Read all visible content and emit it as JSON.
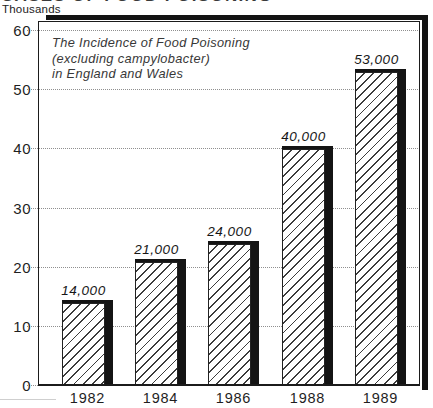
{
  "page": {
    "clipped_header": "CASES OF FOOD POISONING",
    "unit_label": "Thousands"
  },
  "chart_data": {
    "type": "bar",
    "title_lines": [
      "The Incidence of Food Poisoning",
      "(excluding campylobacter)",
      "in England and Wales"
    ],
    "categories": [
      "1982",
      "1984",
      "1986",
      "1988",
      "1989"
    ],
    "values": [
      14,
      21,
      24,
      40,
      53
    ],
    "values_absolute": [
      14000,
      21000,
      24000,
      40000,
      53000
    ],
    "bar_value_labels": [
      "14,000",
      "21,000",
      "24,000",
      "40,000",
      "53,000"
    ],
    "ylabel": "Thousands",
    "yticks": [
      0,
      10,
      20,
      30,
      40,
      50,
      60
    ],
    "ylim": [
      0,
      60
    ],
    "grid": "dotted horizontal",
    "legend": "none",
    "bar_style": "white with black diagonal hatch, black 3-D drop shadow on top and right",
    "colors": {
      "ink": "#1c1c1c",
      "hatch_line": "#3c3c3c",
      "grid_dot": "#8f8f8f",
      "shadow": "#131313",
      "paper": "#ffffff"
    }
  }
}
